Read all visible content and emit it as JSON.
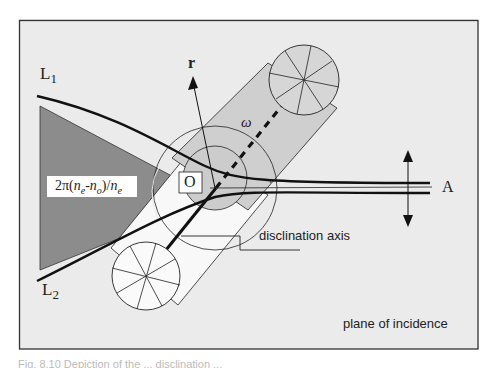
{
  "diagram": {
    "labels": {
      "l1": "L",
      "l1_sub": "1",
      "l2": "L",
      "l2_sub": "2",
      "r": "r",
      "omega": "ω",
      "origin": "O",
      "phase_formula": "2π(n",
      "phase_formula_full": "2π(ne-no)/ne",
      "analyzer": "A",
      "disclination_axis": "disclination axis",
      "plane_of_incidence": "plane of incidence"
    },
    "colors": {
      "background_panel": "#ebebeb",
      "dark_wedge": "#8c8c8c",
      "cylinder_fill": "#cfcfcf",
      "stroke": "#111111"
    },
    "caption_partial": "Fig. 8.10 Depiction of the ... disclination ..."
  }
}
